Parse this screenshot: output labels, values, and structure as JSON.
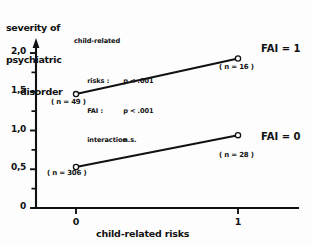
{
  "chart_data": {
    "type": "line",
    "title": "",
    "xlabel": "child-related risks",
    "ylabel": "severity of psychiatric disorder",
    "ylabel_lines": [
      "severity of",
      "psychiatric",
      "disorder"
    ],
    "x": [
      0,
      1
    ],
    "xtick_labels": [
      "0",
      "1"
    ],
    "ytick_labels": [
      "0",
      "0,5",
      "1,0",
      "1,5",
      "2,0"
    ],
    "ytick_values": [
      0,
      0.5,
      1.0,
      1.5,
      2.0
    ],
    "ylim": [
      0,
      2.15
    ],
    "xlim": [
      -0.28,
      1.3
    ],
    "grid": false,
    "legend_position": "right-of-lines",
    "marker": "open-circle",
    "series": [
      {
        "name": "FAI = 1",
        "values": [
          1.47,
          1.93
        ],
        "point_labels": [
          "( n = 49 )",
          "( n = 16 )"
        ],
        "n": [
          49,
          16
        ]
      },
      {
        "name": "FAI = 0",
        "values": [
          0.53,
          0.94
        ],
        "point_labels": [
          "( n = 306 )",
          "( n = 28 )"
        ],
        "n": [
          306,
          28
        ]
      }
    ],
    "annotations": {
      "stats_heading": "child-related",
      "rows": [
        {
          "key": "risks :",
          "value": "p < .001"
        },
        {
          "key": "FAI :",
          "value": "p < .001"
        },
        {
          "key": "interaction",
          "value": "n.s."
        }
      ]
    },
    "colors": {
      "line": "#111111",
      "axis": "#111111",
      "marker_face": "#ffffff",
      "background": "#ffffff",
      "text": "#111111"
    }
  }
}
